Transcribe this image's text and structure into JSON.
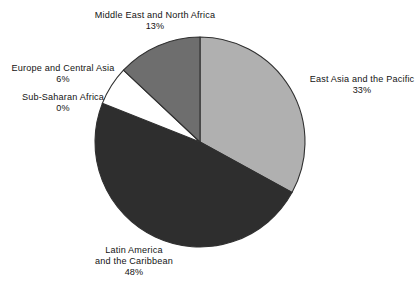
{
  "chart_data": {
    "type": "pie",
    "title": "",
    "subtitle": "",
    "xlabel": "",
    "ylabel": "",
    "legend_position": "none",
    "grid": false,
    "value_unit": "%",
    "start_angle_deg": 0,
    "direction": "clockwise",
    "categories": [
      "East Asia and the Pacific",
      "Latin America and the Caribbean",
      "Sub-Saharan Africa",
      "Europe and Central Asia",
      "Middle East and North Africa"
    ],
    "values": [
      33,
      48,
      0,
      6,
      13
    ],
    "slices": [
      {
        "label": "East Asia and the Pacific",
        "label_line1": "East Asia and the Pacific",
        "value": 33,
        "value_label": "33%",
        "color": "#b0b0b0"
      },
      {
        "label": "Latin America and the Caribbean",
        "label_line1": "Latin America",
        "label_line2": "and the Caribbean",
        "value": 48,
        "value_label": "48%",
        "color": "#2e2e2e"
      },
      {
        "label": "Sub-Saharan Africa",
        "label_line1": "Sub-Saharan Africa",
        "value": 0,
        "value_label": "0%",
        "color": "#ffffff"
      },
      {
        "label": "Europe and Central Asia",
        "label_line1": "Europe and Central Asia",
        "value": 6,
        "value_label": "6%",
        "color": "#ffffff"
      },
      {
        "label": "Middle East and North Africa",
        "label_line1": "Middle East and North Africa",
        "value": 13,
        "value_label": "13%",
        "color": "#6e6e6e"
      }
    ]
  },
  "colors": {
    "background": "#ffffff",
    "outline": "#303030",
    "text": "#131313",
    "slice_east_asia": "#b0b0b0",
    "slice_latin_america": "#2e2e2e",
    "slice_sub_saharan": "#ffffff",
    "slice_europe": "#ffffff",
    "slice_middle_east": "#6e6e6e"
  }
}
